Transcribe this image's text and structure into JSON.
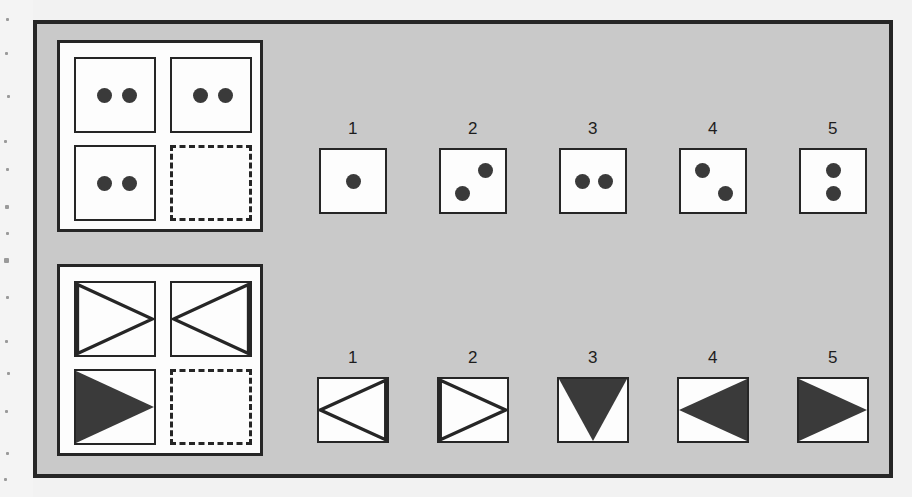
{
  "colors": {
    "card_background": "#c9c9c9",
    "panel_background": "#fdfdfd",
    "ink": "#262626",
    "shape_fill": "#3a3a3a",
    "page_background": "#f2f2f2"
  },
  "problems": [
    {
      "id": "dots",
      "matrix": {
        "cells": [
          {
            "position": "top-left",
            "content": "two-dots-horizontal",
            "dots": 2,
            "state": "filled"
          },
          {
            "position": "top-right",
            "content": "two-dots-horizontal",
            "dots": 2,
            "state": "filled"
          },
          {
            "position": "bottom-left",
            "content": "two-dots-horizontal",
            "dots": 2,
            "state": "filled"
          },
          {
            "position": "bottom-right",
            "content": "empty",
            "dots": 0,
            "state": "missing"
          }
        ]
      },
      "options": [
        {
          "number": "1",
          "arrangement": "single",
          "dots": 1
        },
        {
          "number": "2",
          "arrangement": "antidiag",
          "dots": 2
        },
        {
          "number": "3",
          "arrangement": "horizontal",
          "dots": 2
        },
        {
          "number": "4",
          "arrangement": "diag",
          "dots": 2
        },
        {
          "number": "5",
          "arrangement": "vertical",
          "dots": 2
        }
      ]
    },
    {
      "id": "triangles",
      "matrix": {
        "cells": [
          {
            "position": "top-left",
            "content": "triangle-right-outline",
            "state": "filled"
          },
          {
            "position": "top-right",
            "content": "triangle-left-outline",
            "state": "filled"
          },
          {
            "position": "bottom-left",
            "content": "triangle-right-solid",
            "state": "filled"
          },
          {
            "position": "bottom-right",
            "content": "empty",
            "state": "missing"
          }
        ]
      },
      "options": [
        {
          "number": "1",
          "shape": "triangle-left-outline"
        },
        {
          "number": "2",
          "shape": "triangle-right-outline"
        },
        {
          "number": "3",
          "shape": "triangle-down-solid"
        },
        {
          "number": "4",
          "shape": "triangle-left-solid"
        },
        {
          "number": "5",
          "shape": "triangle-right-solid"
        }
      ]
    }
  ]
}
